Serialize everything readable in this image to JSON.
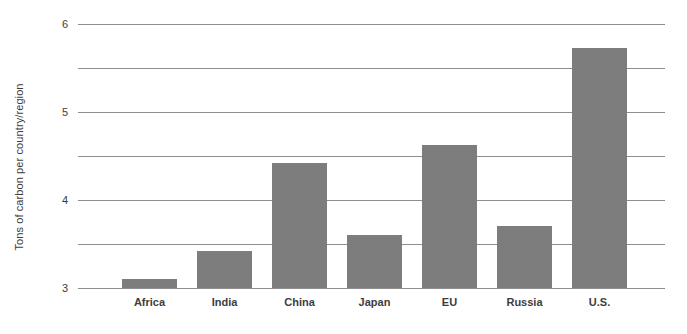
{
  "chart_data": {
    "type": "bar",
    "title": "",
    "subtitle": "",
    "xlabel": "",
    "ylabel": "Tons of carbon per country/region",
    "categories": [
      "Africa",
      "India",
      "China",
      "Japan",
      "EU",
      "Russia",
      "U.S."
    ],
    "values": [
      0.2,
      0.85,
      2.85,
      1.2,
      3.25,
      1.42,
      5.45
    ],
    "ylim": [
      0,
      6
    ],
    "yticks": [
      0,
      1,
      2,
      3,
      4,
      5,
      6
    ],
    "ytick_labels": [
      "0",
      "1",
      "2",
      "3",
      "4",
      "5",
      "6"
    ],
    "grid": true,
    "grid_axis": "y",
    "legend": false,
    "legend_position": "none",
    "bar_color": "#7d7d7d",
    "gridline_color": "#8e8e8e",
    "background_color": "#ffffff",
    "text_color": "#3d3d3d"
  }
}
